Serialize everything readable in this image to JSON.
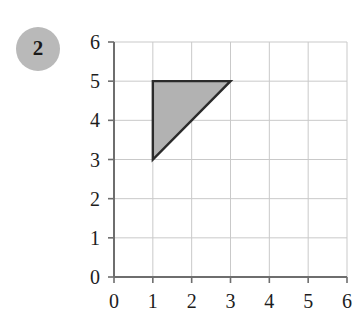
{
  "badge": {
    "label": "2",
    "color": "#b9b9b9",
    "text_color": "#1a1a1a"
  },
  "chart_data": {
    "type": "scatter",
    "title": "",
    "xlabel": "",
    "ylabel": "",
    "xlim": [
      0,
      6
    ],
    "ylim": [
      0,
      6
    ],
    "x_ticks": [
      "0",
      "1",
      "2",
      "3",
      "4",
      "5",
      "6"
    ],
    "y_ticks": [
      "0",
      "1",
      "2",
      "3",
      "4",
      "5",
      "6"
    ],
    "grid": true,
    "legend": null,
    "grid_color": "#c9c9c9",
    "axis_color": "#6e6e6e",
    "shapes": [
      {
        "name": "shaded-triangle",
        "kind": "polygon",
        "vertices": [
          [
            1,
            5
          ],
          [
            3,
            5
          ],
          [
            1,
            3
          ]
        ],
        "fill": "#b2b2b2",
        "stroke": "#2b2b2b",
        "stroke_width": 2.4
      }
    ]
  }
}
